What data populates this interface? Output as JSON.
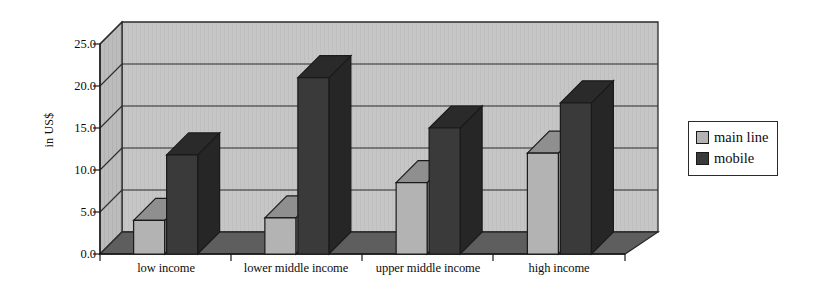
{
  "chart_data": {
    "type": "bar",
    "title": "",
    "subtitle": "",
    "xlabel": "",
    "ylabel": "in US$",
    "categories": [
      "low income",
      "lower middle income",
      "upper middle income",
      "high income"
    ],
    "series": [
      {
        "name": "main line",
        "values": [
          4.0,
          4.3,
          8.5,
          12.0
        ],
        "color": "#b3b3b3"
      },
      {
        "name": "mobile",
        "values": [
          11.8,
          21.0,
          15.0,
          18.0
        ],
        "color": "#3a3a3a"
      }
    ],
    "ylim": [
      0.0,
      25.0
    ],
    "ytick_labels": [
      "0.0",
      "5.0",
      "10.0",
      "15.0",
      "20.0",
      "25.0"
    ],
    "ytick_values": [
      0.0,
      5.0,
      10.0,
      15.0,
      20.0,
      25.0
    ],
    "grid": true,
    "grid_axis": "y",
    "legend_position": "right",
    "style": "3d-column",
    "colors": {
      "wall": "#c6c6c6",
      "side_wall": "#b9b9b9",
      "floor": "#5e5e5e",
      "grid_line": "#2b2b2b",
      "axis_line": "#1a1a1a",
      "main_line_front": "#b3b3b3",
      "main_line_top": "#8f8f8f",
      "main_line_side": "#9a9a9a",
      "mobile_front": "#3a3a3a",
      "mobile_top": "#2a2a2a",
      "mobile_side": "#262626",
      "text": "#0d0d0d",
      "background": "#ffffff"
    }
  },
  "axis": {
    "y_title": "in US$",
    "ticks": [
      {
        "label": "25.0"
      },
      {
        "label": "20.0"
      },
      {
        "label": "15.0"
      },
      {
        "label": "10.0"
      },
      {
        "label": "5.0"
      },
      {
        "label": "0.0"
      }
    ]
  },
  "x_axis": {
    "labels": [
      {
        "text": "low income"
      },
      {
        "text": "lower middle income"
      },
      {
        "text": "upper middle income"
      },
      {
        "text": "high income"
      }
    ]
  },
  "legend": {
    "items": [
      {
        "label": "main line"
      },
      {
        "label": "mobile"
      }
    ]
  }
}
